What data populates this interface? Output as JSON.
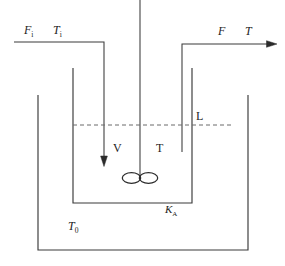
{
  "figure": {
    "kind": "process-flow-schematic",
    "line_color": "#3a3a3a",
    "dash_color": "#6a6a6a",
    "text_color": "#1d1d1d",
    "background": "#ffffff"
  },
  "labels": {
    "inlet_flow": {
      "symbol": "F",
      "subscript": "i"
    },
    "inlet_temperature": {
      "symbol": "T",
      "subscript": "i"
    },
    "outlet_flow": {
      "symbol": "F",
      "subscript": ""
    },
    "outlet_temperature": {
      "symbol": "T",
      "subscript": ""
    },
    "liquid_level": {
      "symbol": "L",
      "subscript": ""
    },
    "volume": {
      "symbol": "V",
      "subscript": ""
    },
    "reactor_temperature": {
      "symbol": "T",
      "subscript": ""
    },
    "gain_constant": {
      "symbol": "K",
      "subscript": "A"
    },
    "jacket_temperature": {
      "symbol": "T",
      "subscript": "0"
    }
  },
  "elements": {
    "agitator_shaft": "agitator-shaft",
    "impeller": "impeller-blades",
    "inlet_pipe": "inlet-pipe",
    "inlet_arrow": "inlet-flow-arrow",
    "outlet_pipe": "outlet-pipe",
    "outlet_arrow": "outlet-flow-arrow",
    "inner_vessel": "inner-vessel-wall",
    "outer_jacket": "outer-jacket-wall",
    "level_line": "liquid-level-dashed-line"
  },
  "geometry": {
    "canvas": {
      "width": 285,
      "height": 266
    },
    "inner_vessel": {
      "left_x": 73,
      "right_x": 192,
      "top_y": 68,
      "bottom_y": 203
    },
    "outer_jacket": {
      "left_x": 38,
      "right_x": 248,
      "top_y": 95,
      "bottom_y": 250
    },
    "liquid_level_y": 125,
    "shaft_x": 140,
    "impeller_y": 178,
    "inlet_header_y": 42,
    "inlet_down_x": 104,
    "inlet_arrow_tip_y": 166,
    "outlet_header_y": 44,
    "outlet_up_x": 182,
    "outlet_pipe_bottom_y": 152,
    "outlet_arrow_tip_x": 276
  }
}
